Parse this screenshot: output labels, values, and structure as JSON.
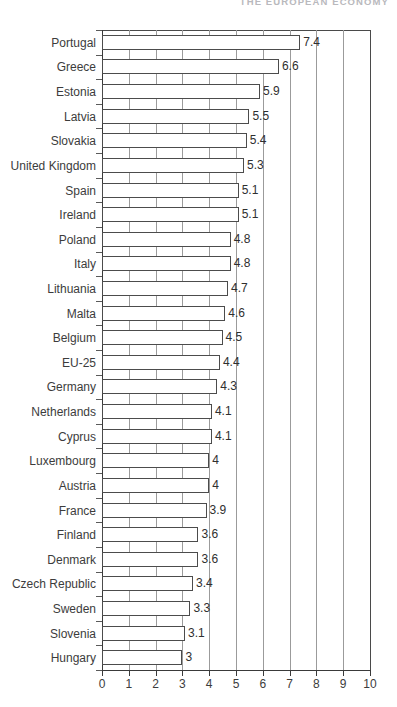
{
  "running_header": {
    "text": "THE EUROPEAN ECONOMY"
  },
  "chart_data": {
    "type": "bar",
    "orientation": "horizontal",
    "title": "",
    "subtitle": "",
    "xlabel": "",
    "ylabel": "",
    "xlim": [
      0,
      10
    ],
    "xticks": [
      "0",
      "1",
      "2",
      "3",
      "4",
      "5",
      "6",
      "7",
      "8",
      "9",
      "10"
    ],
    "grid": "vertical",
    "legend": "none",
    "bar_style": {
      "fill": "#ffffff",
      "outline": "#4c4c4c"
    },
    "categories": [
      "Portugal",
      "Greece",
      "Estonia",
      "Latvia",
      "Slovakia",
      "United Kingdom",
      "Spain",
      "Ireland",
      "Poland",
      "Italy",
      "Lithuania",
      "Malta",
      "Belgium",
      "EU-25",
      "Germany",
      "Netherlands",
      "Cyprus",
      "Luxembourg",
      "Austria",
      "France",
      "Finland",
      "Denmark",
      "Czech Republic",
      "Sweden",
      "Slovenia",
      "Hungary"
    ],
    "values": [
      7.4,
      6.6,
      5.9,
      5.5,
      5.4,
      5.3,
      5.1,
      5.1,
      4.8,
      4.8,
      4.7,
      4.6,
      4.5,
      4.4,
      4.3,
      4.1,
      4.1,
      4,
      4,
      3.9,
      3.6,
      3.6,
      3.4,
      3.3,
      3.1,
      3
    ],
    "value_labels": [
      "7.4",
      "6.6",
      "5.9",
      "5.5",
      "5.4",
      "5.3",
      "5.1",
      "5.1",
      "4.8",
      "4.8",
      "4.7",
      "4.6",
      "4.5",
      "4.4",
      "4.3",
      "4.1",
      "4.1",
      "4",
      "4",
      "3.9",
      "3.6",
      "3.6",
      "3.4",
      "3.3",
      "3.1",
      "3"
    ]
  }
}
